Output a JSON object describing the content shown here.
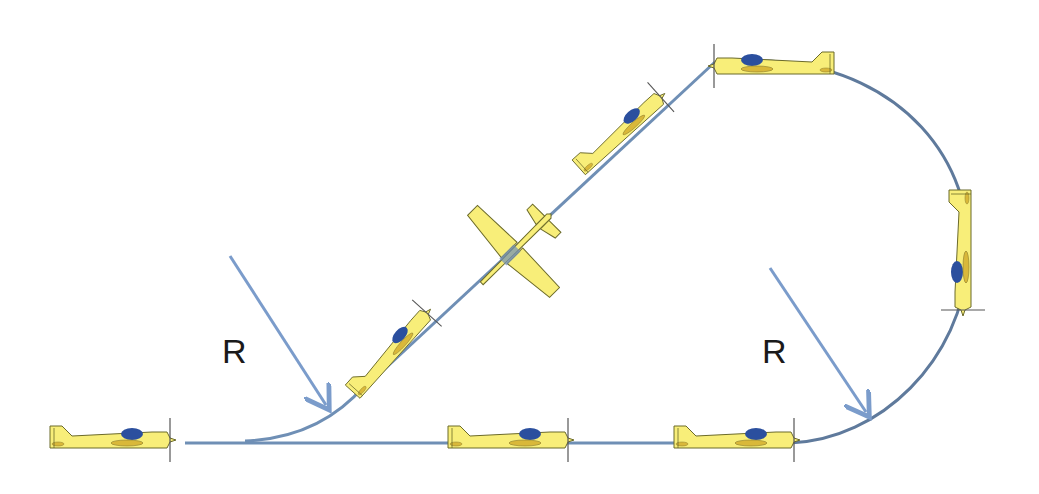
{
  "diagram": {
    "labels": [
      {
        "id": "r-left",
        "text": "R",
        "x": 222,
        "y": 332
      },
      {
        "id": "r-right",
        "text": "R",
        "x": 762,
        "y": 332
      }
    ],
    "colors": {
      "path": "#6f8fb5",
      "path_dark": "#5f7a9c",
      "arrow": "#7b9ccb",
      "plane_body": "#f8ee79",
      "plane_outline": "#6b6a2a",
      "canopy": "#2b4f9e",
      "detail": "#d9b83a",
      "prop": "#555555"
    },
    "planes": [
      {
        "id": "plane-start",
        "x": 112,
        "y": 440,
        "angle": 0
      },
      {
        "id": "plane-bottom-mid",
        "x": 515,
        "y": 440,
        "angle": 0
      },
      {
        "id": "plane-bottom-right",
        "x": 740,
        "y": 440,
        "angle": 0
      },
      {
        "id": "plane-climb-low",
        "x": 390,
        "y": 355,
        "angle": -48
      },
      {
        "id": "plane-climb-high",
        "x": 622,
        "y": 132,
        "angle": -42
      },
      {
        "id": "plane-top",
        "x": 775,
        "y": 66,
        "angle": 180
      },
      {
        "id": "plane-right-vertical",
        "x": 963,
        "y": 250,
        "angle": 90
      }
    ],
    "snap_roll_plane": {
      "id": "plane-snap-roll",
      "x": 510,
      "y": 255
    }
  }
}
